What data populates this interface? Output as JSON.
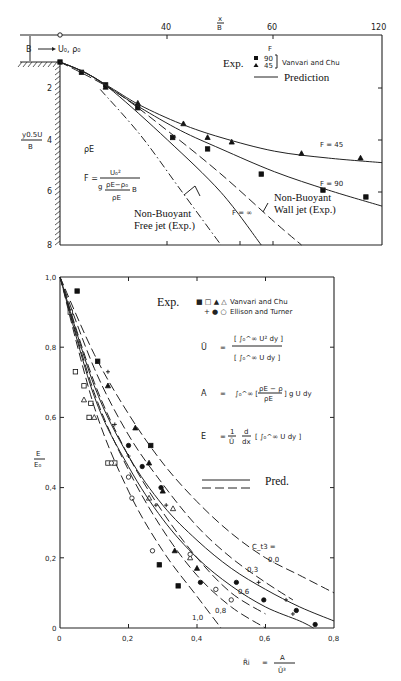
{
  "chart_data": [
    {
      "type": "line",
      "title": "",
      "xlabel": "x/B",
      "ylabel": "y0.5U/B",
      "x_ticks": [
        "40",
        "60",
        "120"
      ],
      "y_ticks": [
        "2",
        "4",
        "6",
        "8"
      ],
      "xlim": [
        0,
        120
      ],
      "ylim": [
        8,
        0
      ],
      "labels": {
        "inlet": "B",
        "inlet_flow": "U₀, ρ₀",
        "ambient_density": "ρE",
        "froude_formula": "F = U₀² / (g (ρE−ρ₀)/ρE · B)",
        "free_jet": [
          "Non-Buoyant",
          "Free jet (Exp.)"
        ],
        "wall_jet": [
          "Non-Buoyant",
          "Wall jet (Exp.)"
        ],
        "f_inf": "F = ∞",
        "f45": "F = 45",
        "f90": "F = 90"
      },
      "legend": {
        "header": "F",
        "exp_label": "Exp.",
        "entries": [
          {
            "marker": "square-filled",
            "value": "90"
          },
          {
            "marker": "triangle-filled",
            "value": "45"
          }
        ],
        "source": "Vanvari and Chu",
        "prediction_label": "Prediction"
      },
      "series": [
        {
          "name": "Exp. F=90 (Vanvari and Chu)",
          "marker": "square",
          "x": [
            0,
            8,
            17,
            29,
            42,
            55,
            75,
            98,
            114
          ],
          "y": [
            0,
            0.45,
            1.0,
            2.0,
            3.3,
            3.8,
            4.9,
            5.6,
            5.9
          ]
        },
        {
          "name": "Exp. F=45 (Vanvari and Chu)",
          "marker": "triangle",
          "x": [
            17,
            29,
            46,
            55,
            64,
            90,
            112
          ],
          "y": [
            1.1,
            1.8,
            2.7,
            3.3,
            3.5,
            4.0,
            4.2
          ]
        },
        {
          "name": "Prediction F=45",
          "style": "solid",
          "x": [
            0,
            10,
            20,
            30,
            45,
            60,
            80,
            100,
            120
          ],
          "y": [
            0,
            0.5,
            1.2,
            1.9,
            2.7,
            3.3,
            3.9,
            4.2,
            4.4
          ]
        },
        {
          "name": "Prediction F=90",
          "style": "solid",
          "x": [
            0,
            10,
            20,
            30,
            45,
            60,
            80,
            100,
            120
          ],
          "y": [
            0,
            0.5,
            1.25,
            2.0,
            3.0,
            3.8,
            4.8,
            5.6,
            6.3
          ]
        },
        {
          "name": "Prediction F=∞",
          "style": "solid",
          "x": [
            0,
            10,
            20,
            40,
            60,
            75
          ],
          "y": [
            0,
            0.5,
            1.3,
            3.4,
            5.7,
            8.0
          ]
        },
        {
          "name": "Non-Buoyant Wall jet (Exp.)",
          "style": "dashed",
          "x": [
            0,
            20,
            40,
            60,
            80,
            90
          ],
          "y": [
            0,
            1.25,
            3.0,
            4.9,
            7.0,
            8.0
          ]
        },
        {
          "name": "Non-Buoyant Free jet (Exp.)",
          "style": "dash-dot",
          "x": [
            15,
            30,
            45,
            60
          ],
          "y": [
            1.2,
            3.2,
            5.6,
            8.0
          ]
        }
      ]
    },
    {
      "type": "scatter",
      "title": "",
      "xlabel": "R̄i = A / Ū³",
      "ylabel": "E/E₀",
      "x_ticks": [
        "0",
        "0,2",
        "0,4",
        "0,6",
        "0,8"
      ],
      "y_ticks": [
        "0",
        "0,2",
        "0,4",
        "0,6",
        "0,8",
        "1,0"
      ],
      "xlim": [
        0,
        0.8
      ],
      "ylim": [
        0,
        1.0
      ],
      "legend": {
        "exp_label": "Exp.",
        "rows": [
          {
            "markers": "■ □ ▲ △",
            "source": "Vanvari and Chu"
          },
          {
            "markers": "+ ● ○",
            "source": "Ellison and Turner"
          }
        ],
        "pred_label": "Pred."
      },
      "equations": {
        "U": {
          "lhs": "Ū",
          "num": "[∫₀^∞ U² dy]",
          "den": "[∫₀^∞ U dy]"
        },
        "A": {
          "lhs": "A",
          "rhs": "∫₀^∞ [(ρE − ρ)/ρE] g U dy"
        },
        "E": {
          "lhs": "E",
          "rhs": "(1/Ū) d/dx [∫₀^∞ U dy]"
        }
      },
      "curve_labels": {
        "title": "C_t3 =",
        "values": [
          "0,0",
          "0,3",
          "0,6",
          "0,8",
          "1,0"
        ]
      },
      "series": [
        {
          "name": "Vanvari and Chu ■",
          "marker": "square-filled",
          "x": [
            0.05,
            0.11,
            0.265,
            0.29,
            0.345
          ],
          "y": [
            0.96,
            0.76,
            0.52,
            0.18,
            0.12
          ]
        },
        {
          "name": "Vanvari and Chu □",
          "marker": "square-open",
          "x": [
            0.03,
            0.045,
            0.07,
            0.09,
            0.085,
            0.14,
            0.16
          ],
          "y": [
            0.9,
            0.73,
            0.69,
            0.64,
            0.6,
            0.47,
            0.47
          ]
        },
        {
          "name": "Vanvari and Chu ▲",
          "marker": "triangle-filled",
          "x": [
            0.14,
            0.22,
            0.26,
            0.3,
            0.335,
            0.4
          ],
          "y": [
            0.69,
            0.57,
            0.47,
            0.39,
            0.22,
            0.17
          ]
        },
        {
          "name": "Vanvari and Chu △",
          "marker": "triangle-open",
          "x": [
            0.07,
            0.1,
            0.26,
            0.33,
            0.38
          ],
          "y": [
            0.65,
            0.6,
            0.37,
            0.34,
            0.2
          ]
        },
        {
          "name": "Ellison and Turner +",
          "marker": "plus",
          "x": [
            0.14,
            0.16,
            0.2,
            0.28,
            0.31,
            0.58,
            0.68,
            0.66
          ],
          "y": [
            0.73,
            0.58,
            0.49,
            0.35,
            0.35,
            0.13,
            0.04,
            0.08
          ]
        },
        {
          "name": "Ellison and Turner ●",
          "marker": "circle-filled",
          "x": [
            0.2,
            0.24,
            0.295,
            0.41,
            0.515,
            0.595,
            0.69,
            0.745
          ],
          "y": [
            0.52,
            0.46,
            0.4,
            0.13,
            0.13,
            0.08,
            0.05,
            0.01
          ]
        },
        {
          "name": "Ellison and Turner ○",
          "marker": "circle-open",
          "x": [
            0.15,
            0.2,
            0.21,
            0.27,
            0.455,
            0.5,
            0.38
          ],
          "y": [
            0.47,
            0.43,
            0.37,
            0.22,
            0.11,
            0.08,
            0.21
          ]
        },
        {
          "name": "Pred. Ct3=0.0",
          "style": "dashed",
          "x": [
            0,
            0.1,
            0.2,
            0.3,
            0.4,
            0.5,
            0.6,
            0.7,
            0.8
          ],
          "y": [
            1.0,
            0.78,
            0.61,
            0.47,
            0.36,
            0.27,
            0.2,
            0.15,
            0.1
          ]
        },
        {
          "name": "Pred. Ct3=0.3",
          "style": "dashed",
          "x": [
            0,
            0.1,
            0.2,
            0.3,
            0.4,
            0.5,
            0.6,
            0.68
          ],
          "y": [
            1.0,
            0.74,
            0.55,
            0.41,
            0.29,
            0.2,
            0.13,
            0.08
          ]
        },
        {
          "name": "Pred. Ct3=0.6",
          "style": "dashed",
          "x": [
            0,
            0.1,
            0.2,
            0.3,
            0.4,
            0.5,
            0.6
          ],
          "y": [
            1.0,
            0.7,
            0.49,
            0.33,
            0.2,
            0.1,
            0.04
          ]
        },
        {
          "name": "Pred. Ct3=0.8",
          "style": "dashed",
          "x": [
            0,
            0.1,
            0.2,
            0.3,
            0.4,
            0.5,
            0.6
          ],
          "y": [
            1.0,
            0.67,
            0.45,
            0.28,
            0.15,
            0.06,
            0.0
          ]
        },
        {
          "name": "Pred. Ct3=1.0",
          "style": "dashed",
          "x": [
            0,
            0.1,
            0.2,
            0.3,
            0.4,
            0.47
          ],
          "y": [
            1.0,
            0.63,
            0.39,
            0.22,
            0.09,
            0.0
          ]
        },
        {
          "name": "Pred. solid upper",
          "style": "solid",
          "x": [
            0,
            0.1,
            0.2,
            0.3,
            0.4,
            0.5,
            0.6,
            0.7,
            0.8
          ],
          "y": [
            1.0,
            0.69,
            0.49,
            0.35,
            0.25,
            0.17,
            0.11,
            0.06,
            0.02
          ]
        },
        {
          "name": "Pred. solid lower",
          "style": "solid",
          "x": [
            0,
            0.1,
            0.2,
            0.3,
            0.4,
            0.5,
            0.6,
            0.7,
            0.74
          ],
          "y": [
            1.0,
            0.66,
            0.46,
            0.31,
            0.2,
            0.12,
            0.06,
            0.02,
            0.0
          ]
        }
      ]
    }
  ]
}
